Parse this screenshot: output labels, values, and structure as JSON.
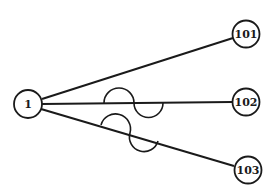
{
  "diagram": {
    "type": "star-graph",
    "colors": {
      "stroke": "#1a1a1a",
      "background": "#ffffff"
    },
    "nodes": [
      {
        "id": "1",
        "label": "1"
      },
      {
        "id": "101",
        "label": "101"
      },
      {
        "id": "102",
        "label": "102"
      },
      {
        "id": "103",
        "label": "103"
      }
    ],
    "edges": [
      {
        "from": "1",
        "to": "101",
        "style": "straight"
      },
      {
        "from": "1",
        "to": "102",
        "style": "straight-with-s-wave"
      },
      {
        "from": "1",
        "to": "103",
        "style": "straight-with-s-wave"
      }
    ]
  }
}
